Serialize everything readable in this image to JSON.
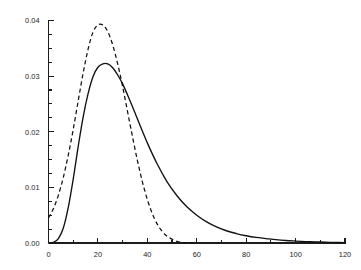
{
  "chart_data": {
    "type": "line",
    "title": "",
    "subtitle": "",
    "xlabel": "",
    "ylabel": "",
    "xlim": [
      0,
      120
    ],
    "ylim": [
      0,
      0.04
    ],
    "grid": false,
    "legend": "none",
    "background_color": "#ffffff",
    "line_color": "#111111",
    "x_ticks_major": [
      0,
      20,
      40,
      60,
      80,
      100,
      120
    ],
    "x_tick_labels": [
      "0",
      "20",
      "40",
      "60",
      "80",
      "100",
      "120"
    ],
    "x_ticks_minor": [
      10,
      30,
      50,
      70,
      90,
      110
    ],
    "y_ticks_major": [
      0.0,
      0.01,
      0.02,
      0.03,
      0.04
    ],
    "y_tick_labels": [
      "0.00",
      "0.01",
      "0.02",
      "0.03",
      "0.04"
    ],
    "y_ticks_minor": [
      0.0025,
      0.005,
      0.0075,
      0.0125,
      0.015,
      0.0175,
      0.0225,
      0.025,
      0.0275,
      0.0325,
      0.035,
      0.0375
    ],
    "series": [
      {
        "name": "dashed-curve",
        "style": "dashed",
        "peak_x": 22,
        "peak_y": 0.0392,
        "x": [
          0,
          2,
          4,
          6,
          8,
          10,
          12,
          14,
          16,
          18,
          20,
          22,
          24,
          26,
          28,
          30,
          32,
          34,
          36,
          38,
          40,
          42,
          44,
          46,
          48,
          50,
          52,
          54,
          56,
          58,
          60
        ],
        "values": [
          0.0045,
          0.0062,
          0.0086,
          0.0118,
          0.0158,
          0.0204,
          0.0255,
          0.0305,
          0.0348,
          0.0379,
          0.0392,
          0.0392,
          0.038,
          0.0356,
          0.0322,
          0.0281,
          0.0236,
          0.0191,
          0.0148,
          0.011,
          0.0078,
          0.0053,
          0.0034,
          0.0021,
          0.0012,
          0.0007,
          0.0003,
          0.0001,
          3e-05,
          1e-05,
          0.0
        ]
      },
      {
        "name": "solid-curve",
        "style": "solid",
        "peak_x": 24,
        "peak_y": 0.0322,
        "x": [
          0,
          2,
          4,
          6,
          8,
          10,
          12,
          14,
          16,
          18,
          20,
          22,
          24,
          26,
          28,
          30,
          32,
          34,
          36,
          40,
          44,
          48,
          52,
          56,
          60,
          64,
          68,
          72,
          76,
          80,
          84,
          88,
          92,
          96,
          100,
          104,
          108,
          112,
          116,
          120
        ],
        "values": [
          0.0,
          0.0001,
          0.0008,
          0.0027,
          0.0064,
          0.0115,
          0.0173,
          0.0226,
          0.0268,
          0.0299,
          0.0316,
          0.0322,
          0.0322,
          0.0315,
          0.0302,
          0.0286,
          0.0266,
          0.0245,
          0.0223,
          0.018,
          0.0142,
          0.011,
          0.0085,
          0.0065,
          0.005,
          0.0038,
          0.0029,
          0.0022,
          0.0017,
          0.0013,
          0.001,
          0.0008,
          0.0006,
          0.00045,
          0.00035,
          0.00026,
          0.0002,
          0.00015,
          0.0001,
          8e-05
        ]
      }
    ],
    "crossing_point": {
      "x": 32,
      "y": 0.0255
    }
  }
}
